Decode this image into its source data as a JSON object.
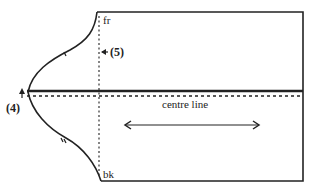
{
  "diagram": {
    "type": "pattern-draft",
    "labels": {
      "front": "fr",
      "back": "bk",
      "centre_line": "centre line",
      "marker_4": "(4)",
      "marker_5": "(5)"
    },
    "colors": {
      "line": "#222222",
      "background": "#ffffff"
    }
  }
}
